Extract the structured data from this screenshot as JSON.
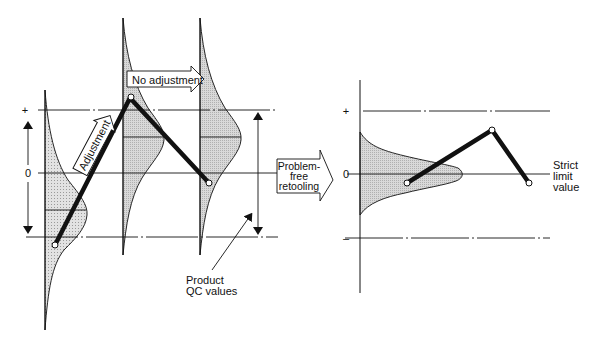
{
  "left_chart": {
    "axis_labels": {
      "plus": "+",
      "zero": "0",
      "minus": "–"
    },
    "arrows": {
      "no_adjustment": "No adjustment",
      "adjustment": "Adjustment"
    },
    "annotation": {
      "line1": "Product",
      "line2": "QC values"
    },
    "points": [
      {
        "x": 55,
        "y": 245
      },
      {
        "x": 130,
        "y": 98
      },
      {
        "x": 209,
        "y": 183
      }
    ]
  },
  "transition_arrow": {
    "line1": "Problem-",
    "line2": "free",
    "line3": "retooling"
  },
  "right_chart": {
    "axis_labels": {
      "plus": "+",
      "zero": "0",
      "minus": "–"
    },
    "annotation": {
      "line1": "Strict",
      "line2": "limit",
      "line3": "value"
    },
    "points": [
      {
        "x": 407,
        "y": 183
      },
      {
        "x": 492,
        "y": 130
      },
      {
        "x": 529,
        "y": 183
      }
    ]
  },
  "colors": {
    "fill": "#d4d4d4",
    "line": "#111111"
  }
}
